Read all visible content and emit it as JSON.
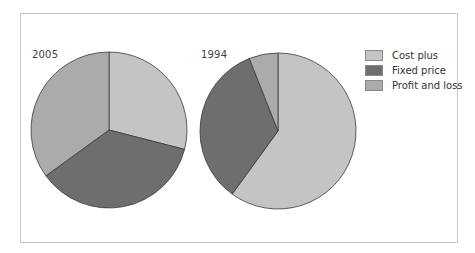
{
  "chart_data": {
    "type": "pie",
    "title": "",
    "legend_position": "right",
    "legend": [
      {
        "label": "Cost plus",
        "color": "#c4c4c4"
      },
      {
        "label": "Fixed price",
        "color": "#6e6e6e"
      },
      {
        "label": "Profit and loss",
        "color": "#ababab"
      }
    ],
    "categories": [
      "Cost plus",
      "Fixed price",
      "Profit and loss"
    ],
    "series": [
      {
        "name": "2005",
        "values": [
          29,
          36,
          35
        ]
      },
      {
        "name": "1994",
        "values": [
          60,
          34,
          6
        ]
      }
    ],
    "pies": [
      {
        "label": "2005",
        "cx": 109,
        "cy": 130,
        "r": 78,
        "label_x": 32,
        "label_y": 49
      },
      {
        "label": "1994",
        "cx": 278,
        "cy": 131,
        "r": 78,
        "label_x": 201,
        "label_y": 49
      }
    ],
    "start_angle": "12 o'clock, clockwise"
  }
}
